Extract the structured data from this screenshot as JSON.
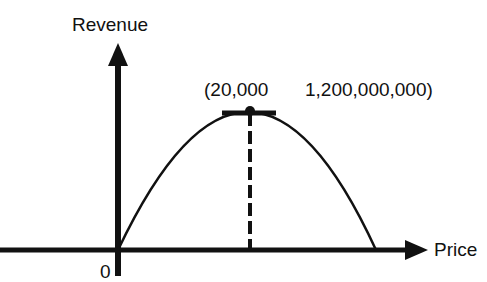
{
  "diagram": {
    "y_axis_label": "Revenue",
    "x_axis_label": "Price",
    "origin_label": "0",
    "peak_label_x": "(20,000",
    "peak_label_y": "1,200,000,000)",
    "curve": "parabola (inverted)",
    "peak": {
      "price": 20000,
      "revenue": 1200000000
    },
    "colors": {
      "ink": "#111111",
      "background": "#ffffff"
    }
  }
}
